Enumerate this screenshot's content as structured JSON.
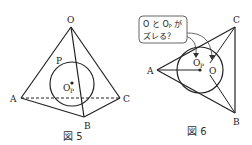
{
  "figure5": {
    "caption": "図 5",
    "labels": {
      "O": "O",
      "A": "A",
      "B": "B",
      "C": "C",
      "P": "P",
      "Op": "O",
      "Op_sub": "P"
    }
  },
  "figure6": {
    "caption": "図 6",
    "labels": {
      "A": "A",
      "B": "B",
      "C": "C",
      "O": "O",
      "Op": "O",
      "Op_sub": "P"
    },
    "bubble": {
      "line1": "O と O",
      "line1_sub": "P",
      "line1_tail": " が",
      "line2": "ズレる？"
    }
  },
  "colors": {
    "stroke": "#222222",
    "bubble_border": "#555555",
    "background": "#ffffff"
  }
}
